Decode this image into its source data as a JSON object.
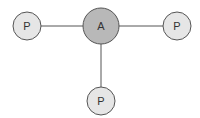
{
  "diagram": {
    "type": "star-graph",
    "colors": {
      "center_fill": "#b8b8b8",
      "leaf_fill": "#e6e6e6",
      "stroke": "#555555",
      "text": "#333333",
      "background": "#ffffff"
    },
    "nodes": [
      {
        "id": "A",
        "label": "A",
        "role": "center",
        "cx": 101,
        "cy": 26,
        "r": 18
      },
      {
        "id": "P1",
        "label": "P",
        "role": "leaf",
        "cx": 27,
        "cy": 26,
        "r": 14
      },
      {
        "id": "P2",
        "label": "P",
        "role": "leaf",
        "cx": 177,
        "cy": 26,
        "r": 14
      },
      {
        "id": "P3",
        "label": "P",
        "role": "leaf",
        "cx": 101,
        "cy": 101,
        "r": 14
      }
    ],
    "edges": [
      {
        "from": "A",
        "to": "P1"
      },
      {
        "from": "A",
        "to": "P2"
      },
      {
        "from": "A",
        "to": "P3"
      }
    ]
  }
}
